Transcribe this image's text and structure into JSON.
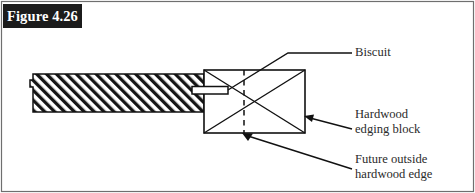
{
  "figure": {
    "label": "Figure 4.26",
    "border_color": "#6f6f6f",
    "background_color": "#ffffff",
    "label_background_color": "#1b1b1b",
    "label_text_color": "#ffffff",
    "line_color": "#111111"
  },
  "callouts": {
    "biscuit": {
      "line1": "Biscuit",
      "line2": ""
    },
    "hardwood_block": {
      "line1": "Hardwood",
      "line2": "edging block"
    },
    "future_edge": {
      "line1": "Future outside",
      "line2": "hardwood edge"
    }
  },
  "diagram": {
    "panel_name": "hatched-plywood-panel",
    "biscuit_name": "biscuit-tenon",
    "block_name": "hardwood-edging-block",
    "dashed_line_name": "future-outside-edge-dashed-line"
  }
}
